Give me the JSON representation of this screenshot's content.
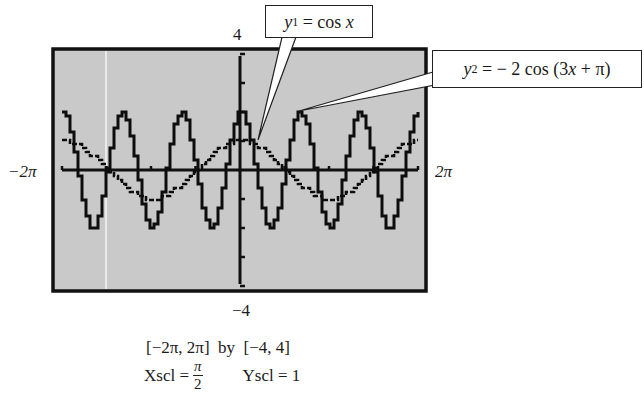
{
  "chart_data": {
    "type": "line",
    "title": "",
    "xlabel": "",
    "ylabel": "",
    "xlim": [
      -6.2832,
      6.2832
    ],
    "ylim": [
      -4,
      4
    ],
    "xlim_labels": [
      "-2π",
      "2π"
    ],
    "ylim_labels": [
      "-4",
      "4"
    ],
    "xscl": "π/2",
    "yscl": 1,
    "grid": false,
    "legend": "callouts",
    "background": "#c8c8c8",
    "series": [
      {
        "name": "y1 = cos x",
        "expression": "cos(x)",
        "amplitude": 1,
        "period": 6.2832,
        "x": [
          -6.2832,
          -4.7124,
          -3.1416,
          -1.5708,
          0,
          1.5708,
          3.1416,
          4.7124,
          6.2832
        ],
        "values": [
          1,
          0,
          -1,
          0,
          1,
          0,
          -1,
          0,
          1
        ]
      },
      {
        "name": "y2 = -2 cos (3x + π)",
        "expression": "-2*cos(3*x + pi)",
        "amplitude": 2,
        "period": 2.0944,
        "x": [
          -6.2832,
          -5.236,
          -4.1888,
          -3.1416,
          -2.0944,
          -1.0472,
          0,
          1.0472,
          2.0944,
          3.1416,
          4.1888,
          5.236,
          6.2832
        ],
        "values": [
          2,
          -2,
          2,
          -2,
          2,
          -2,
          2,
          -2,
          2,
          -2,
          2,
          -2,
          2
        ]
      }
    ]
  },
  "axis_labels": {
    "y_max": "4",
    "y_min": "−4",
    "x_min": "−2π",
    "x_max": "2π"
  },
  "callouts": {
    "y1": {
      "var": "y",
      "sub": "1",
      "rest": " = cos ",
      "x": "x"
    },
    "y2": {
      "var": "y",
      "sub": "2",
      "rest": " = − 2 cos (3",
      "x": "x",
      "tail": " + π)"
    }
  },
  "caption": {
    "window": "[−2π, 2π]  by  [−4, 4]",
    "xscl_label": "Xscl =",
    "xscl_num": "π",
    "xscl_den": "2",
    "yscl": "Yscl = 1"
  }
}
